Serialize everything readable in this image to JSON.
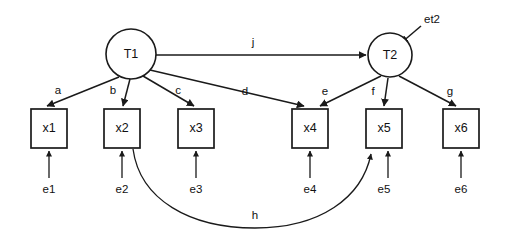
{
  "diagram": {
    "colors": {
      "stroke": "#1a1a1a",
      "fill": "#ffffff",
      "text": "#111111",
      "background": "#ffffff"
    },
    "latent_nodes": [
      {
        "id": "T1",
        "label": "T1",
        "cx": 131,
        "cy": 54,
        "r": 25
      },
      {
        "id": "T2",
        "label": "T2",
        "cx": 390,
        "cy": 55,
        "r": 22
      }
    ],
    "observed_nodes": [
      {
        "id": "x1",
        "label": "x1",
        "x": 31,
        "y": 109,
        "w": 36,
        "h": 39
      },
      {
        "id": "x2",
        "label": "x2",
        "x": 104,
        "y": 109,
        "w": 36,
        "h": 39
      },
      {
        "id": "x3",
        "label": "x3",
        "x": 178,
        "y": 109,
        "w": 36,
        "h": 39
      },
      {
        "id": "x4",
        "label": "x4",
        "x": 292,
        "y": 109,
        "w": 36,
        "h": 39
      },
      {
        "id": "x5",
        "label": "x5",
        "x": 366,
        "y": 109,
        "w": 36,
        "h": 39
      },
      {
        "id": "x6",
        "label": "x6",
        "x": 443,
        "y": 109,
        "w": 36,
        "h": 39
      }
    ],
    "error_terms": [
      {
        "id": "e1",
        "label": "e1",
        "x": 49,
        "y": 189
      },
      {
        "id": "e2",
        "label": "e2",
        "x": 122,
        "y": 189
      },
      {
        "id": "e3",
        "label": "e3",
        "x": 196,
        "y": 189
      },
      {
        "id": "e4",
        "label": "e4",
        "x": 310,
        "y": 189
      },
      {
        "id": "e5",
        "label": "e5",
        "x": 384,
        "y": 189
      },
      {
        "id": "e6",
        "label": "e6",
        "x": 461,
        "y": 189
      },
      {
        "id": "et2",
        "label": "et2",
        "x": 430,
        "y": 19
      }
    ],
    "path_labels": [
      {
        "id": "a",
        "label": "a",
        "x": 58,
        "y": 94
      },
      {
        "id": "b",
        "label": "b",
        "x": 113,
        "y": 94
      },
      {
        "id": "c",
        "label": "c",
        "x": 178,
        "y": 94
      },
      {
        "id": "d",
        "label": "d",
        "x": 245,
        "y": 95
      },
      {
        "id": "e",
        "label": "e",
        "x": 325,
        "y": 95
      },
      {
        "id": "f",
        "label": "f",
        "x": 373,
        "y": 95
      },
      {
        "id": "g",
        "label": "g",
        "x": 450,
        "y": 95
      },
      {
        "id": "h",
        "label": "h",
        "x": 255,
        "y": 219
      },
      {
        "id": "j",
        "label": "j",
        "x": 253,
        "y": 46
      }
    ],
    "edges": [
      {
        "id": "T1-x1",
        "label": "a",
        "from": "T1",
        "to": "x1",
        "type": "directed"
      },
      {
        "id": "T1-x2",
        "label": "b",
        "from": "T1",
        "to": "x2",
        "type": "directed"
      },
      {
        "id": "T1-x3",
        "label": "c",
        "from": "T1",
        "to": "x3",
        "type": "directed"
      },
      {
        "id": "T1-x4",
        "label": "d",
        "from": "T1",
        "to": "x4",
        "type": "directed"
      },
      {
        "id": "T2-x4",
        "label": "e",
        "from": "T2",
        "to": "x4",
        "type": "directed"
      },
      {
        "id": "T2-x5",
        "label": "f",
        "from": "T2",
        "to": "x5",
        "type": "directed"
      },
      {
        "id": "T2-x6",
        "label": "g",
        "from": "T2",
        "to": "x6",
        "type": "directed"
      },
      {
        "id": "x2-x5",
        "label": "h",
        "from": "x2",
        "to": "x5",
        "type": "curved"
      },
      {
        "id": "T1-T2",
        "label": "j",
        "from": "T1",
        "to": "T2",
        "type": "directed"
      },
      {
        "id": "et2-T2",
        "label": "et2",
        "from": "et2",
        "to": "T2",
        "type": "directed"
      },
      {
        "id": "e1-x1",
        "label": "e1",
        "from": "e1",
        "to": "x1",
        "type": "directed"
      },
      {
        "id": "e2-x2",
        "label": "e2",
        "from": "e2",
        "to": "x2",
        "type": "directed"
      },
      {
        "id": "e3-x3",
        "label": "e3",
        "from": "e3",
        "to": "x3",
        "type": "directed"
      },
      {
        "id": "e4-x4",
        "label": "e4",
        "from": "e4",
        "to": "x4",
        "type": "directed"
      },
      {
        "id": "e5-x5",
        "label": "e5",
        "from": "e5",
        "to": "x5",
        "type": "directed"
      },
      {
        "id": "e6-x6",
        "label": "e6",
        "from": "e6",
        "to": "x6",
        "type": "directed"
      }
    ]
  }
}
